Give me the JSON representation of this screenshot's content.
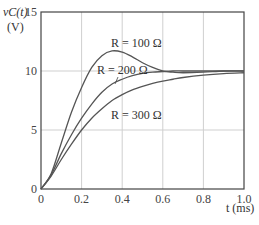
{
  "chart_data": {
    "type": "line",
    "title": "",
    "xlabel": "t (ms)",
    "ylabel": "v_C(t) (V)",
    "ylabel_line1": "vC(t)",
    "ylabel_line2": "(V)",
    "xlabel_text": "t (ms)",
    "xlim": [
      0,
      1.0
    ],
    "ylim": [
      0,
      15
    ],
    "grid": true,
    "x_ticks": [
      "0",
      "0.2",
      "0.4",
      "0.6",
      "0.8",
      "1.0"
    ],
    "y_ticks": [
      "0",
      "5",
      "10",
      "15"
    ],
    "x": [
      0,
      0.05,
      0.1,
      0.15,
      0.2,
      0.25,
      0.3,
      0.35,
      0.4,
      0.45,
      0.5,
      0.55,
      0.6,
      0.65,
      0.7,
      0.8,
      0.9,
      1.0
    ],
    "series": [
      {
        "name": "R = 100 Ω",
        "label": "R = 100 Ω",
        "values": [
          0,
          1.3,
          3.9,
          6.5,
          8.6,
          10.3,
          11.3,
          11.7,
          11.6,
          11.2,
          10.7,
          10.3,
          10.0,
          9.9,
          9.85,
          9.9,
          10.0,
          10.0
        ]
      },
      {
        "name": "R = 200 Ω",
        "label": "R = 200 Ω",
        "values": [
          0,
          1.2,
          3.0,
          4.6,
          6.0,
          7.2,
          8.2,
          8.9,
          9.3,
          9.6,
          9.8,
          9.9,
          9.95,
          10.0,
          10.0,
          10.0,
          10.0,
          10.0
        ]
      },
      {
        "name": "R = 300 Ω",
        "label": "R = 300 Ω",
        "values": [
          0,
          1.1,
          2.5,
          3.8,
          5.0,
          6.0,
          6.8,
          7.5,
          8.0,
          8.4,
          8.7,
          8.95,
          9.15,
          9.3,
          9.45,
          9.65,
          9.78,
          9.85
        ]
      }
    ]
  }
}
